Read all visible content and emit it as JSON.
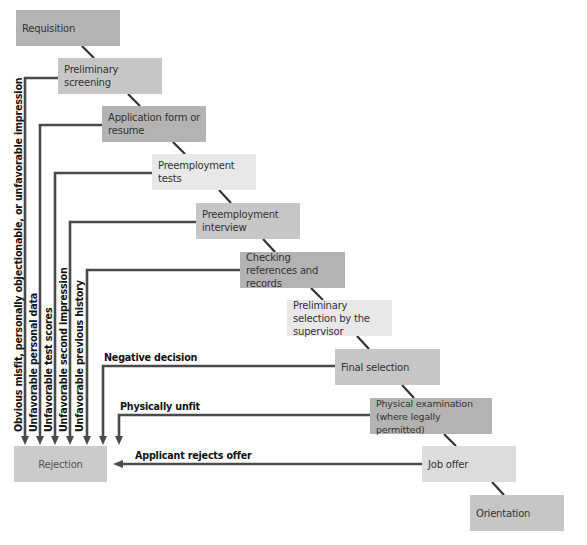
{
  "diagram": {
    "steps": [
      {
        "label": "Requisition"
      },
      {
        "label": "Preliminary  screening"
      },
      {
        "label": "Application form or resume"
      },
      {
        "label": "Preemployment tests"
      },
      {
        "label": "Preemployment interview"
      },
      {
        "label": "Checking references and records"
      },
      {
        "label": "Preliminary selection by the  supervisor"
      },
      {
        "label": "Final selection"
      },
      {
        "label": "Physical examination (where legally permitted)"
      },
      {
        "label": "Job offer"
      },
      {
        "label": "Orientation"
      }
    ],
    "rejection": {
      "label": "Rejection"
    },
    "rejection_reasons": [
      "Obvious misfit, personally objectionable, or unfavorable impression",
      "Unfavorable personal data",
      "Unfavorable test scores",
      "Unfavorable second impression",
      "Unfavorable previous history",
      "Negative decision",
      "Physically unfit",
      "Applicant rejects offer"
    ],
    "colors": {
      "line": "#4a4a4a",
      "box_dark": "#b3b3b3",
      "box_mid": "#c6c6c6",
      "box_light": "#dcdcdc",
      "box_lighter": "#e8e8e8"
    }
  }
}
